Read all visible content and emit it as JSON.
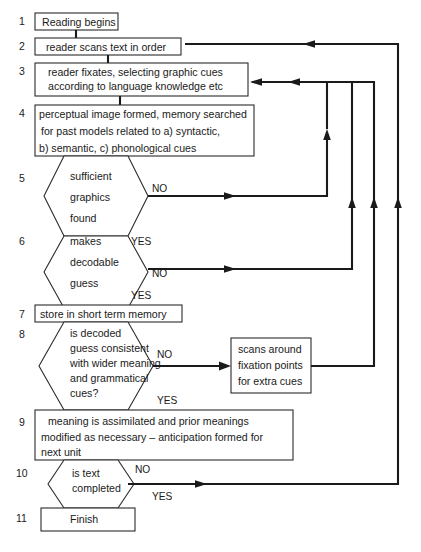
{
  "diagram": {
    "accent_color": "#1a1a1a",
    "box_fill": "#ffffff",
    "stroke_color": "#2b2b2b"
  },
  "steps": [
    {
      "num": "1",
      "shape": "box",
      "lines": [
        "Reading begins"
      ]
    },
    {
      "num": "2",
      "shape": "box",
      "lines": [
        "reader scans text in order"
      ]
    },
    {
      "num": "3",
      "shape": "box",
      "lines": [
        "reader fixates, selecting graphic cues",
        "according to language knowledge etc"
      ]
    },
    {
      "num": "4",
      "shape": "box",
      "lines": [
        "perceptual image formed, memory searched",
        "for past models related to a) syntactic,",
        "b) semantic, c) phonological cues"
      ]
    },
    {
      "num": "5",
      "shape": "hexagon",
      "lines": [
        "sufficient",
        "graphics",
        "found"
      ]
    },
    {
      "num": "6",
      "shape": "hexagon",
      "lines": [
        "makes",
        "decodable",
        "guess"
      ]
    },
    {
      "num": "7",
      "shape": "box",
      "lines": [
        "store in short term memory"
      ]
    },
    {
      "num": "8",
      "shape": "hexagon",
      "lines": [
        "is decoded",
        "guess consistent",
        "with wider meaning",
        "and grammatical",
        "cues?"
      ]
    },
    {
      "num": "9",
      "shape": "box",
      "lines": [
        "meaning is assimilated and prior meanings",
        "modified as necessary – anticipation formed for",
        "next unit"
      ]
    },
    {
      "num": "10",
      "shape": "hexagon",
      "lines": [
        "is text",
        "completed"
      ]
    },
    {
      "num": "11",
      "shape": "box",
      "lines": [
        "Finish"
      ]
    }
  ],
  "side_box": {
    "lines": [
      "scans around",
      "fixation points",
      "for extra cues"
    ]
  },
  "edge_labels": {
    "n5_no": "NO",
    "n5_yes": "YES",
    "n6_no": "NO",
    "n6_yes": "YES",
    "n8_no": "NO",
    "n8_yes": "YES",
    "n10_no": "NO",
    "n10_yes": "YES"
  }
}
